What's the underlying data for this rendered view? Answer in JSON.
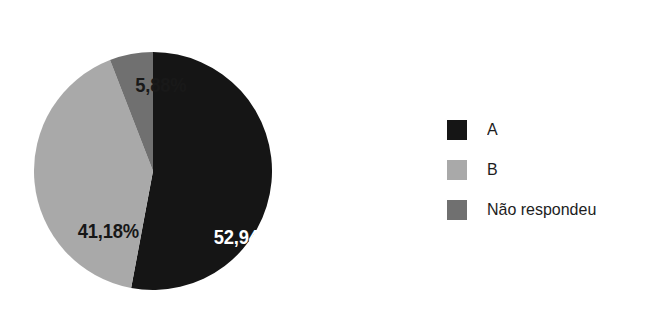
{
  "chart_data": {
    "type": "pie",
    "title": "",
    "subtitle": "",
    "xlabel": "",
    "ylabel": "",
    "grid": false,
    "legend_position": "right",
    "categories": [
      "A",
      "B",
      "Não respondeu"
    ],
    "values": [
      52.94,
      41.18,
      5.88
    ],
    "value_labels": [
      "52,94%",
      "41,18%",
      "5,88%"
    ],
    "colors": [
      "#121212",
      "#a8a8a8",
      "#6e6e6e"
    ],
    "label_text_colors": [
      "#ffffff",
      "#141414",
      "#161616"
    ],
    "start_angle_deg": 0,
    "direction": "clockwise",
    "units": "percent",
    "annotations": []
  },
  "pie": {
    "slices": [
      {
        "name": "A",
        "value": 52.94,
        "label": "52,94%",
        "color": "#121212",
        "label_color": "#ffffff",
        "label_placement": "inside"
      },
      {
        "name": "B",
        "value": 41.18,
        "label": "41,18%",
        "color": "#a8a8a8",
        "label_color": "#141414",
        "label_placement": "inside"
      },
      {
        "name": "Não respondeu",
        "value": 5.88,
        "label": "5,88%",
        "color": "#6e6e6e",
        "label_color": "#161616",
        "label_placement": "outside-top"
      }
    ]
  },
  "legend": {
    "items": [
      {
        "label": "A",
        "color": "#121212"
      },
      {
        "label": "B",
        "color": "#a8a8a8"
      },
      {
        "label": "Não respondeu",
        "color": "#6e6e6e"
      }
    ]
  },
  "canvas": {
    "background": "#ffffff"
  }
}
